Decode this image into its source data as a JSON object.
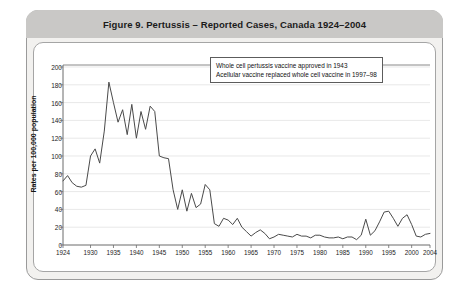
{
  "figure": {
    "title": "Figure 9. Pertussis – Reported Cases, Canada 1924–2004"
  },
  "legend": {
    "lines": [
      "Whole cell pertussis vaccine approved in 1943",
      "Acellular vaccine replaced whole cell vaccine in 1997–98"
    ]
  },
  "colors": {
    "frame_border": "#9a9a9a",
    "title_bar": "#c9c8c6",
    "panel_background": "#ffffff",
    "page_background": "#f2f1ef",
    "line": "#4a4a4a",
    "gridline": "#d8d8d8",
    "axis": "#6b6b6b",
    "text": "#1b1b1b"
  },
  "chart_data": {
    "type": "line",
    "title": "Figure 9. Pertussis – Reported Cases, Canada 1924–2004",
    "xlabel": "",
    "ylabel": "Rates per 100,000 population",
    "xlim": [
      1924,
      2004
    ],
    "ylim": [
      0,
      200
    ],
    "yticks": [
      0,
      20,
      40,
      60,
      80,
      100,
      120,
      140,
      160,
      180,
      200
    ],
    "xticks": [
      1924,
      1930,
      1935,
      1940,
      1945,
      1950,
      1955,
      1960,
      1965,
      1970,
      1975,
      1980,
      1985,
      1990,
      1995,
      2000,
      2004
    ],
    "grid": true,
    "legend_position": "top-right",
    "annotations": [
      "Whole cell pertussis vaccine approved in 1943",
      "Acellular vaccine replaced whole cell vaccine in 1997–98"
    ],
    "series": [
      {
        "name": "Reported pertussis cases per 100,000 population",
        "x": [
          1924,
          1925,
          1926,
          1927,
          1928,
          1929,
          1930,
          1931,
          1932,
          1933,
          1934,
          1935,
          1936,
          1937,
          1938,
          1939,
          1940,
          1941,
          1942,
          1943,
          1944,
          1945,
          1946,
          1947,
          1948,
          1949,
          1950,
          1951,
          1952,
          1953,
          1954,
          1955,
          1956,
          1957,
          1958,
          1959,
          1960,
          1961,
          1962,
          1963,
          1964,
          1965,
          1966,
          1967,
          1968,
          1969,
          1970,
          1971,
          1972,
          1973,
          1974,
          1975,
          1976,
          1977,
          1978,
          1979,
          1980,
          1981,
          1982,
          1983,
          1984,
          1985,
          1986,
          1987,
          1988,
          1989,
          1990,
          1991,
          1992,
          1993,
          1994,
          1995,
          1996,
          1997,
          1998,
          1999,
          2000,
          2001,
          2002,
          2003,
          2004
        ],
        "y": [
          72,
          78,
          70,
          66,
          65,
          67,
          100,
          108,
          92,
          128,
          183,
          160,
          138,
          152,
          124,
          158,
          120,
          150,
          130,
          156,
          150,
          100,
          98,
          97,
          62,
          40,
          62,
          38,
          58,
          42,
          46,
          68,
          62,
          24,
          21,
          30,
          28,
          23,
          30,
          20,
          15,
          10,
          14,
          17,
          13,
          7,
          9,
          12,
          11,
          10,
          9,
          12,
          10,
          10,
          8,
          11,
          11,
          9,
          8,
          8,
          9,
          7,
          9,
          9,
          6,
          11,
          29,
          11,
          16,
          26,
          37,
          38,
          30,
          21,
          30,
          34,
          23,
          10,
          9,
          12,
          13
        ]
      }
    ]
  }
}
